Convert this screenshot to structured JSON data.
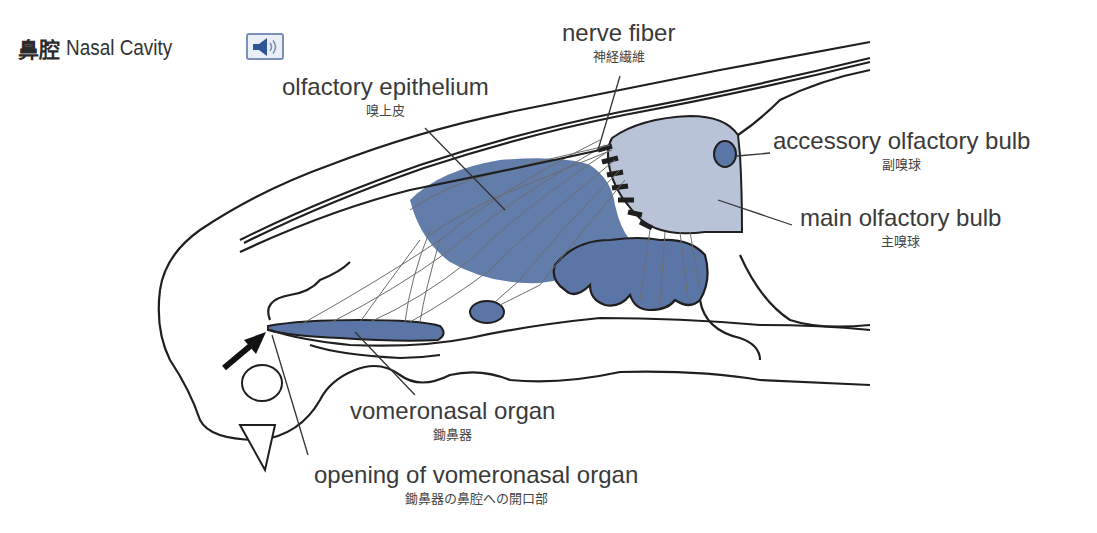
{
  "header": {
    "title_jp": "鼻腔",
    "title_en": "Nasal Cavity",
    "audio_button": "speaker-icon"
  },
  "labels": {
    "nerve_fiber": {
      "en": "nerve fiber",
      "jp": "神経繊維"
    },
    "olfactory_epithelium": {
      "en": "olfactory epithelium",
      "jp": "嗅上皮"
    },
    "accessory_olfactory_bulb": {
      "en": "accessory olfactory bulb",
      "jp": "副嗅球"
    },
    "main_olfactory_bulb": {
      "en": "main olfactory bulb",
      "jp": "主嗅球"
    },
    "vomeronasal_organ": {
      "en": "vomeronasal organ",
      "jp": "鋤鼻器"
    },
    "opening_of_vomeronasal_organ": {
      "en": "opening of vomeronasal organ",
      "jp": "鋤鼻器の鼻腔への開口部"
    }
  },
  "colors": {
    "epithelium_blue": "#5b76a6",
    "bulb_light_blue": "#b8c3d8",
    "outline": "#1f1f1f",
    "nerve_gray": "#6d6d6d",
    "audio_border": "#7b8fb8",
    "audio_fill": "#2f5597"
  }
}
